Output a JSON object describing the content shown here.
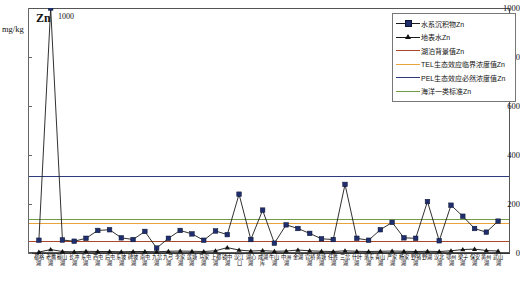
{
  "chart_data": {
    "type": "line",
    "title": "Zn",
    "ylabel": "mg/kg",
    "xlabel": "",
    "ylim": [
      0,
      1000
    ],
    "yticks": [
      0,
      200,
      400,
      600,
      800,
      1000
    ],
    "grid": false,
    "legend_position": "top-right",
    "annotations": [
      {
        "text": "1000",
        "series": "水系沉积物Zn",
        "category": "老鹰湖",
        "note": "off-scale peak clipped at axis maximum"
      }
    ],
    "categories": [
      "都格湖",
      "老鹰湖",
      "碳山湖",
      "长冲湖",
      "东屯湖",
      "西屯湖",
      "后屯湖",
      "东坡湖",
      "碑坡湖",
      "南屯湖",
      "九岔湖",
      "九弓湖",
      "李家湖",
      "莲塘湖",
      "马家湖",
      "上都湖",
      "镜中湖",
      "汉江口",
      "湖心湖",
      "成湖库",
      "牛山湖",
      "中洲湖",
      "金湖",
      "官桥湖",
      "黄塘湖",
      "任胜湖",
      "三岔湖",
      "什叶湖",
      "落东湖",
      "青山湖",
      "严家湖",
      "杨家湖",
      "野猪湖",
      "野湖",
      "汉北湖",
      "鄂州湖",
      "梁子湖",
      "保安湖",
      "黄州湖",
      "武山湖"
    ],
    "series": [
      {
        "name": "水系沉积物Zn",
        "marker": "square",
        "color": "#1f2f6e",
        "line_color": "#1a1a1a",
        "values": [
          52,
          1000,
          53,
          48,
          60,
          92,
          95,
          62,
          55,
          88,
          20,
          60,
          92,
          78,
          52,
          90,
          75,
          240,
          55,
          175,
          40,
          115,
          100,
          80,
          58,
          55,
          280,
          60,
          52,
          95,
          125,
          62,
          60,
          210,
          50,
          195,
          150,
          100,
          85,
          130
        ]
      },
      {
        "name": "地表水Zn",
        "marker": "triangle",
        "color": "#111111",
        "line_color": "#111111",
        "values": [
          4,
          14,
          6,
          5,
          7,
          6,
          6,
          5,
          6,
          6,
          5,
          7,
          8,
          7,
          6,
          9,
          22,
          12,
          8,
          10,
          7,
          8,
          12,
          9,
          7,
          6,
          9,
          7,
          6,
          7,
          8,
          7,
          6,
          7,
          6,
          9,
          14,
          16,
          10,
          8
        ]
      }
    ],
    "reference_lines": [
      {
        "label": "湖泊背景值Zn",
        "value": 48,
        "color": "#a8472a"
      },
      {
        "label": "TEL生态效应临界浓度值Zn",
        "value": 123,
        "color": "#e8a33d"
      },
      {
        "label": "PEL生态效应必然浓度值Zn",
        "value": 315,
        "color": "#2e3c7e"
      },
      {
        "label": "海洋一类标准Zn",
        "value": 140,
        "color": "#6f9b4a"
      }
    ]
  },
  "legend": {
    "items": [
      {
        "label": "水系沉积物Zn",
        "marker": "square",
        "color": "#1f2f6e"
      },
      {
        "label": "地表水Zn",
        "marker": "triangle",
        "color": "#111111"
      },
      {
        "label": "湖泊背景值Zn",
        "marker": "line",
        "color": "#a8472a"
      },
      {
        "label": "TEL生态效应临界浓度值Zn",
        "marker": "line",
        "color": "#e8a33d"
      },
      {
        "label": "PEL生态效应必然浓度值Zn",
        "marker": "line",
        "color": "#2e3c7e"
      },
      {
        "label": "海洋一类标准Zn",
        "marker": "line",
        "color": "#6f9b4a"
      }
    ]
  }
}
